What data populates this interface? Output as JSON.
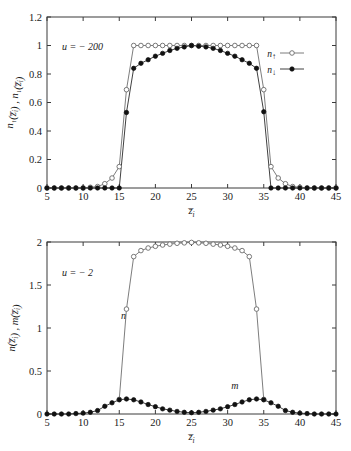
{
  "figure": {
    "background": "#ffffff",
    "axis_color": "#3b3b3b",
    "open_marker_color": "#6a6a6a",
    "filled_marker_color": "#111111",
    "width": 351,
    "height": 451
  },
  "chart_data": [
    {
      "id": "top-panel",
      "type": "line",
      "title": "",
      "annotation": "u = − 200",
      "xlabel": "z̅i",
      "ylabel": "n↑(z̅i) , n↓(z̅i)",
      "xlim": [
        5,
        45
      ],
      "ylim": [
        0,
        1.2
      ],
      "xticks": [
        5,
        10,
        15,
        20,
        25,
        30,
        35,
        40,
        45
      ],
      "xticklabels": [
        "5",
        "10",
        "15",
        "20",
        "25",
        "30",
        "35",
        "40",
        "45"
      ],
      "yticks": [
        0,
        0.2,
        0.4,
        0.6,
        0.8,
        1,
        1.2
      ],
      "yticklabels": [
        "0",
        "0.2",
        "0.4",
        "0.6",
        "0.8",
        "1",
        "1.2"
      ],
      "grid": false,
      "legend_position": "right-upper",
      "series": [
        {
          "name": "n↑",
          "marker": "open-circle",
          "color": "#6a6a6a",
          "x": [
            5,
            6,
            7,
            8,
            9,
            10,
            11,
            12,
            13,
            14,
            15,
            16,
            17,
            18,
            19,
            20,
            21,
            22,
            23,
            24,
            25,
            26,
            27,
            28,
            29,
            30,
            31,
            32,
            33,
            34,
            35,
            36,
            37,
            38,
            39,
            40,
            41,
            42,
            43,
            44,
            45
          ],
          "values": [
            0,
            0,
            0,
            0,
            0,
            0,
            0.005,
            0.01,
            0.03,
            0.07,
            0.15,
            0.69,
            1.0,
            1.0,
            1.0,
            1.0,
            1.0,
            1.0,
            1.0,
            1.0,
            1.0,
            1.0,
            1.0,
            1.0,
            1.0,
            1.0,
            1.0,
            1.0,
            1.0,
            1.0,
            0.69,
            0.15,
            0.07,
            0.03,
            0.01,
            0.005,
            0,
            0,
            0,
            0,
            0
          ]
        },
        {
          "name": "n↓",
          "marker": "filled-circle",
          "color": "#111111",
          "x": [
            5,
            6,
            7,
            8,
            9,
            10,
            11,
            12,
            13,
            14,
            15,
            16,
            17,
            18,
            19,
            20,
            21,
            22,
            23,
            24,
            25,
            26,
            27,
            28,
            29,
            30,
            31,
            32,
            33,
            34,
            35,
            36,
            37,
            38,
            39,
            40,
            41,
            42,
            43,
            44,
            45
          ],
          "values": [
            0,
            0,
            0,
            0,
            0,
            0,
            0,
            0,
            0,
            0,
            0,
            0.53,
            0.84,
            0.875,
            0.9,
            0.925,
            0.945,
            0.965,
            0.98,
            0.99,
            1.0,
            0.995,
            0.99,
            0.98,
            0.965,
            0.945,
            0.925,
            0.9,
            0.875,
            0.84,
            0.535,
            0,
            0,
            0,
            0,
            0,
            0,
            0,
            0,
            0,
            0
          ]
        }
      ]
    },
    {
      "id": "bottom-panel",
      "type": "line",
      "title": "",
      "annotation": "u = − 2",
      "xlabel": "z̅i",
      "ylabel": "n(z̅i) , m(z̅i)",
      "xlim": [
        5,
        45
      ],
      "ylim": [
        0,
        2
      ],
      "xticks": [
        5,
        10,
        15,
        20,
        25,
        30,
        35,
        40,
        45
      ],
      "xticklabels": [
        "5",
        "10",
        "15",
        "20",
        "25",
        "30",
        "35",
        "40",
        "45"
      ],
      "yticks": [
        0,
        0.5,
        1,
        1.5,
        2
      ],
      "yticklabels": [
        "0",
        "0.5",
        "1",
        "1.5",
        "2"
      ],
      "grid": false,
      "legend_position": "inline-labels",
      "inline_labels": [
        {
          "text": "n",
          "x": 15.6,
          "y": 1.1
        },
        {
          "text": "m",
          "x": 31.0,
          "y": 0.29
        }
      ],
      "series": [
        {
          "name": "n",
          "marker": "open-circle",
          "color": "#6a6a6a",
          "x": [
            15,
            16,
            17,
            18,
            19,
            20,
            21,
            22,
            23,
            24,
            25,
            26,
            27,
            28,
            29,
            30,
            31,
            32,
            33,
            34,
            35
          ],
          "values": [
            0.17,
            1.22,
            1.83,
            1.9,
            1.93,
            1.95,
            1.965,
            1.975,
            1.985,
            1.99,
            1.995,
            1.99,
            1.985,
            1.975,
            1.965,
            1.95,
            1.93,
            1.9,
            1.83,
            1.22,
            0.17
          ]
        },
        {
          "name": "m",
          "marker": "filled-circle",
          "color": "#111111",
          "x": [
            5,
            6,
            7,
            8,
            9,
            10,
            11,
            12,
            13,
            14,
            15,
            16,
            17,
            18,
            19,
            20,
            21,
            22,
            23,
            24,
            25,
            26,
            27,
            28,
            29,
            30,
            31,
            32,
            33,
            34,
            35,
            36,
            37,
            38,
            39,
            40,
            41,
            42,
            43,
            44,
            45
          ],
          "values": [
            0,
            0,
            0,
            0,
            0.005,
            0.01,
            0.02,
            0.04,
            0.09,
            0.13,
            0.165,
            0.175,
            0.165,
            0.14,
            0.11,
            0.085,
            0.06,
            0.045,
            0.03,
            0.02,
            0.015,
            0.02,
            0.03,
            0.045,
            0.06,
            0.085,
            0.11,
            0.14,
            0.165,
            0.175,
            0.165,
            0.13,
            0.09,
            0.04,
            0.02,
            0.01,
            0.005,
            0,
            0,
            0,
            0
          ]
        }
      ]
    }
  ]
}
